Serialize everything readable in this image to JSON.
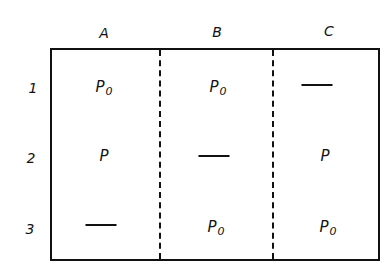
{
  "diagram": {
    "type": "table-grid",
    "columns": [
      "A",
      "B",
      "C"
    ],
    "rows": [
      "1",
      "2",
      "3"
    ],
    "cells": [
      [
        {
          "base": "P",
          "sub": "0"
        },
        {
          "base": "P",
          "sub": "0"
        },
        {
          "base": "—",
          "sub": ""
        }
      ],
      [
        {
          "base": "P",
          "sub": ""
        },
        {
          "base": "—",
          "sub": ""
        },
        {
          "base": "P",
          "sub": ""
        }
      ],
      [
        {
          "base": "—",
          "sub": ""
        },
        {
          "base": "P",
          "sub": "0"
        },
        {
          "base": "P",
          "sub": "0"
        }
      ]
    ],
    "divider_style": "dashed",
    "line_color": "#111111",
    "background": "#ffffff"
  }
}
